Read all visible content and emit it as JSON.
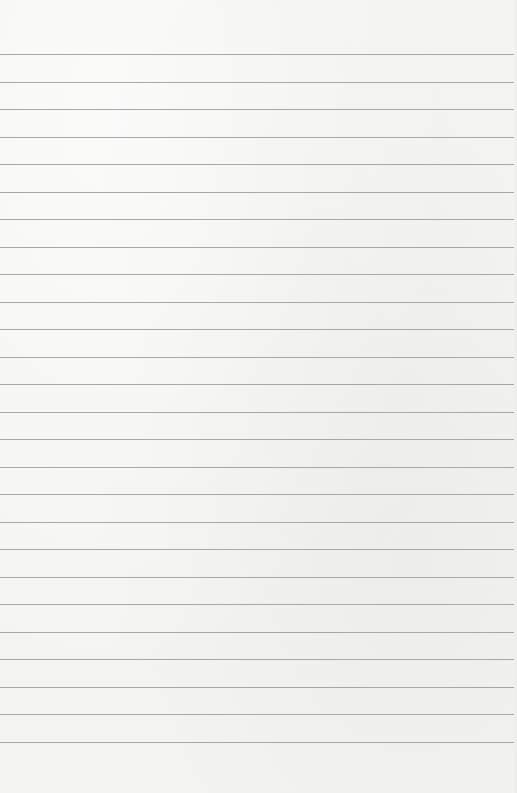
{
  "page": {
    "type": "lined-paper",
    "background_color": "#f4f4f2",
    "rule_color": "#9a9a98",
    "rule_count": 26,
    "first_rule_y": 54,
    "rule_spacing": 27.5
  }
}
